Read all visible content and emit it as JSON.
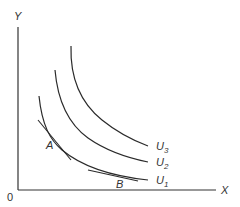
{
  "figure": {
    "type": "indifference-curve-diagram",
    "axes": {
      "y_label": "Y",
      "x_label": "X",
      "origin_label": "0"
    },
    "curves": [
      {
        "name": "U",
        "subscript": "1",
        "label": "U1"
      },
      {
        "name": "U",
        "subscript": "2",
        "label": "U2"
      },
      {
        "name": "U",
        "subscript": "3",
        "label": "U3"
      }
    ],
    "points": [
      {
        "label": "A",
        "on_curve": "U1",
        "tangent": true
      },
      {
        "label": "B",
        "on_curve": "U1",
        "tangent": true
      }
    ],
    "colors": {
      "line": "#2a2a2a",
      "text": "#333333",
      "background": "#ffffff"
    }
  }
}
